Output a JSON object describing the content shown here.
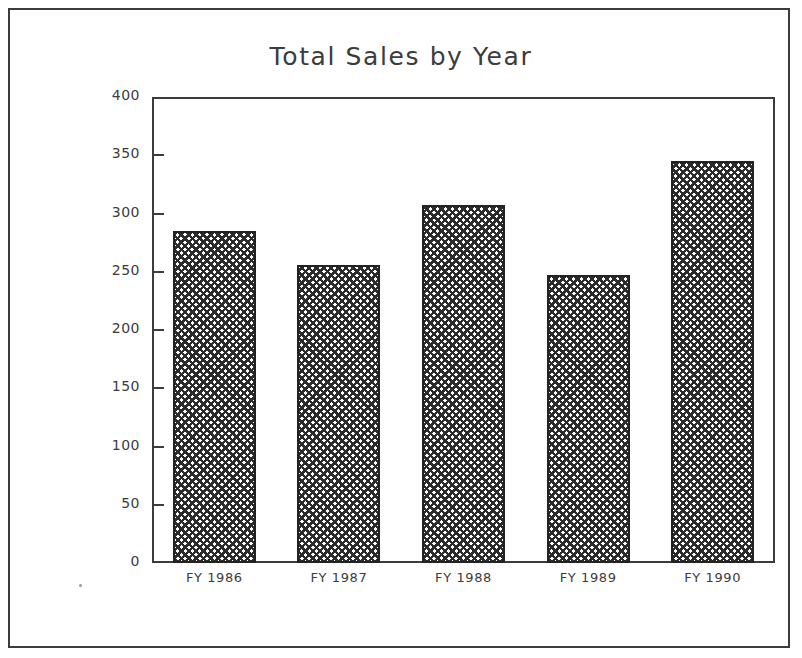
{
  "chart_data": {
    "type": "bar",
    "title": "Total Sales by Year",
    "xlabel": "",
    "ylabel": "Thousands of Dollars",
    "categories": [
      "FY 1986",
      "FY 1987",
      "FY 1988",
      "FY 1989",
      "FY 1990"
    ],
    "values": [
      285,
      256,
      307,
      247,
      345
    ],
    "ylim": [
      0,
      400
    ],
    "ytick_values": [
      0,
      50,
      100,
      150,
      200,
      250,
      300,
      350,
      400
    ],
    "ytick_labels": [
      "0",
      "50",
      "100",
      "150",
      "200",
      "250",
      "300",
      "350",
      "400"
    ],
    "grid": false,
    "legend": null,
    "series": [
      {
        "name": "Total Sales",
        "values": [
          285,
          256,
          307,
          247,
          345
        ]
      }
    ],
    "bar_fill": "crosshatch",
    "colors": {
      "axis": "#3c3c3c",
      "bar_outline": "#222222",
      "bar_pattern": "#2b2b2b",
      "background": "#ffffff"
    }
  },
  "figure": {
    "border": "true"
  }
}
